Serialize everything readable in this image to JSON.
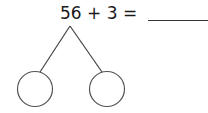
{
  "problem": {
    "equation": "56 + 3 =",
    "answer_blank": ""
  },
  "number_bond": {
    "parts": [
      "",
      ""
    ]
  },
  "colors": {
    "stroke": "#444444",
    "text": "#1a1a1a"
  }
}
